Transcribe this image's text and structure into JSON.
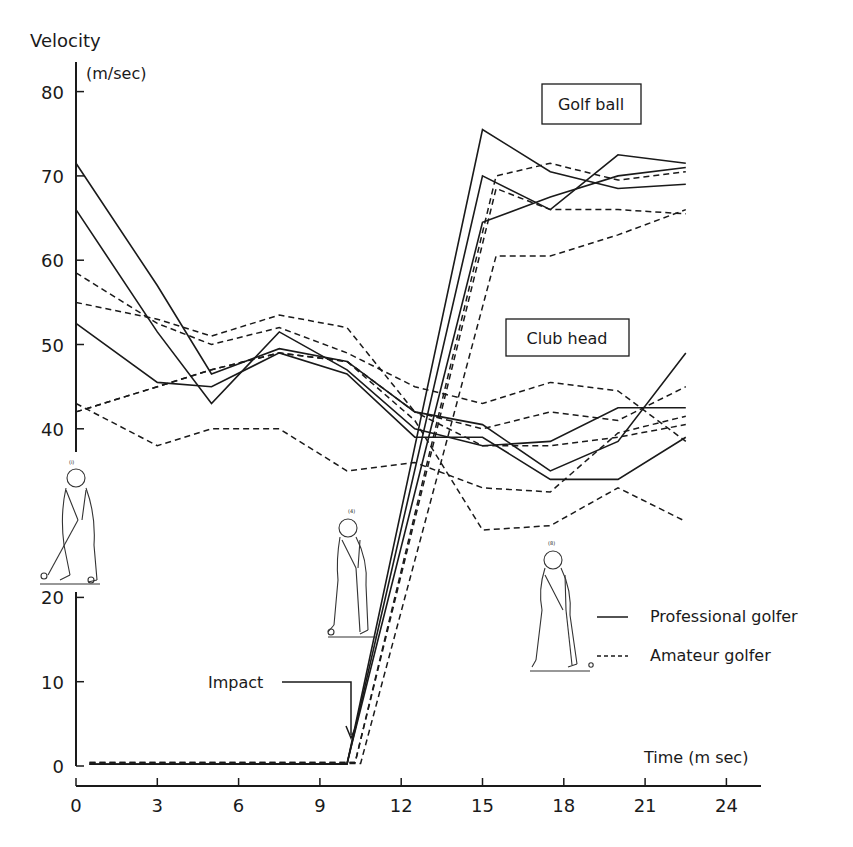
{
  "chart_data": {
    "type": "line",
    "title": "",
    "ylabel": "Velocity",
    "yunit": "(m/sec)",
    "xlabel": "Time (m sec)",
    "xlim": [
      0,
      25
    ],
    "ylim": [
      0,
      82
    ],
    "axis_break": [
      22,
      38
    ],
    "x_ticks": [
      0,
      3,
      6,
      9,
      12,
      15,
      18,
      21,
      24
    ],
    "y_ticks_upper": [
      40,
      50,
      60,
      70,
      80
    ],
    "y_ticks_lower": [
      0,
      10,
      20
    ],
    "grid": false,
    "annotations": {
      "golf_ball_label": "Golf ball",
      "club_head_label": "Club head",
      "impact_label": "Impact",
      "impact_time": 10
    },
    "legend": [
      {
        "label": "Professional golfer",
        "style": "solid"
      },
      {
        "label": "Amateur golfer",
        "style": "dashed"
      }
    ],
    "series": [
      {
        "name": "Professional club head 1",
        "group": "club_head",
        "golfer": "professional",
        "style": "solid",
        "x": [
          0,
          3,
          5,
          7.5,
          10,
          12.5,
          15,
          17.5,
          20,
          22.5
        ],
        "y": [
          71.5,
          57,
          46.5,
          49.5,
          48,
          42,
          40.5,
          35,
          38.5,
          49
        ]
      },
      {
        "name": "Professional club head 2",
        "group": "club_head",
        "golfer": "professional",
        "style": "solid",
        "x": [
          0,
          3,
          5,
          7.5,
          10,
          12.5,
          15,
          17.5,
          20,
          22.5
        ],
        "y": [
          66,
          51.5,
          43,
          51.5,
          47,
          40,
          38,
          38.5,
          42.5,
          42.5
        ]
      },
      {
        "name": "Professional club head 3",
        "group": "club_head",
        "golfer": "professional",
        "style": "solid",
        "x": [
          0,
          3,
          5,
          7.5,
          10,
          12.5,
          15,
          17.5,
          20,
          22.5
        ],
        "y": [
          52.5,
          45.5,
          45,
          49,
          46.5,
          39,
          39,
          34,
          34,
          39
        ]
      },
      {
        "name": "Amateur club head 1",
        "group": "club_head",
        "golfer": "amateur",
        "style": "dashed",
        "x": [
          0,
          3,
          5,
          7.5,
          10,
          12.5,
          15,
          17.5,
          20,
          22.5
        ],
        "y": [
          58.5,
          52.5,
          50,
          52,
          49,
          45,
          43,
          45.5,
          44.5,
          38.5
        ]
      },
      {
        "name": "Amateur club head 2",
        "group": "club_head",
        "golfer": "amateur",
        "style": "dashed",
        "x": [
          0,
          3,
          5,
          7.5,
          10,
          12.5,
          15,
          17.5,
          20,
          22.5
        ],
        "y": [
          55,
          53,
          51,
          53.5,
          52,
          42,
          40,
          42,
          41,
          45
        ]
      },
      {
        "name": "Amateur club head 3",
        "group": "club_head",
        "golfer": "amateur",
        "style": "dashed",
        "x": [
          0,
          3,
          5,
          7.5,
          10,
          12.5,
          15,
          17.5,
          20,
          22.5
        ],
        "y": [
          43,
          38,
          40,
          40,
          35,
          36,
          33,
          32.5,
          39.5,
          41.5
        ]
      },
      {
        "name": "Amateur club head 4",
        "group": "club_head",
        "golfer": "amateur",
        "style": "dashed",
        "x": [
          0,
          3,
          5,
          7.5,
          10,
          12.5,
          15,
          17.5,
          20,
          22.5
        ],
        "y": [
          42,
          45,
          47,
          49,
          48,
          42,
          38,
          38,
          39,
          40.5
        ]
      },
      {
        "name": "Amateur club head 5",
        "group": "club_head",
        "golfer": "amateur",
        "style": "dashed",
        "x": [
          0,
          3,
          5,
          7.5,
          10,
          12.5,
          15,
          17.5,
          20,
          22.5
        ],
        "y": [
          42,
          45,
          47,
          49,
          48,
          41,
          28,
          28.5,
          33,
          29
        ]
      },
      {
        "name": "Professional golf ball 1",
        "group": "golf_ball",
        "golfer": "professional",
        "style": "solid",
        "x": [
          0.5,
          10,
          15,
          17.5,
          20,
          22.5
        ],
        "y": [
          0.2,
          0.2,
          75.5,
          70.5,
          68.5,
          69
        ]
      },
      {
        "name": "Professional golf ball 2",
        "group": "golf_ball",
        "golfer": "professional",
        "style": "solid",
        "x": [
          0.5,
          10,
          15,
          17.5,
          20,
          22.5
        ],
        "y": [
          0.2,
          0.2,
          70,
          66,
          72.5,
          71.5
        ]
      },
      {
        "name": "Professional golf ball 3",
        "group": "golf_ball",
        "golfer": "professional",
        "style": "solid",
        "x": [
          0.5,
          10,
          15,
          17.5,
          20,
          22.5
        ],
        "y": [
          0.2,
          0.3,
          64.5,
          67.5,
          70,
          71
        ]
      },
      {
        "name": "Amateur golf ball 1",
        "group": "golf_ball",
        "golfer": "amateur",
        "style": "dashed",
        "x": [
          0.5,
          10.3,
          15.5,
          17.5,
          20,
          22.5
        ],
        "y": [
          0.4,
          0.4,
          70,
          71.5,
          69.5,
          70.5
        ]
      },
      {
        "name": "Amateur golf ball 2",
        "group": "golf_ball",
        "golfer": "amateur",
        "style": "dashed",
        "x": [
          0.5,
          10.3,
          15.5,
          17.5,
          20,
          22.5
        ],
        "y": [
          0.4,
          0.4,
          68.5,
          66,
          66,
          65.5
        ]
      },
      {
        "name": "Amateur golf ball 3",
        "group": "golf_ball",
        "golfer": "amateur",
        "style": "dashed",
        "x": [
          0.5,
          10.5,
          15.5,
          17.5,
          20,
          22.5
        ],
        "y": [
          0.3,
          0.3,
          60.5,
          60.5,
          63,
          66
        ]
      }
    ]
  },
  "figures": [
    {
      "name": "golfer-address-figure",
      "caption": "(i)"
    },
    {
      "name": "golfer-impact-figure",
      "caption": "(4)"
    },
    {
      "name": "golfer-follow-through-figure",
      "caption": "(8)"
    }
  ]
}
